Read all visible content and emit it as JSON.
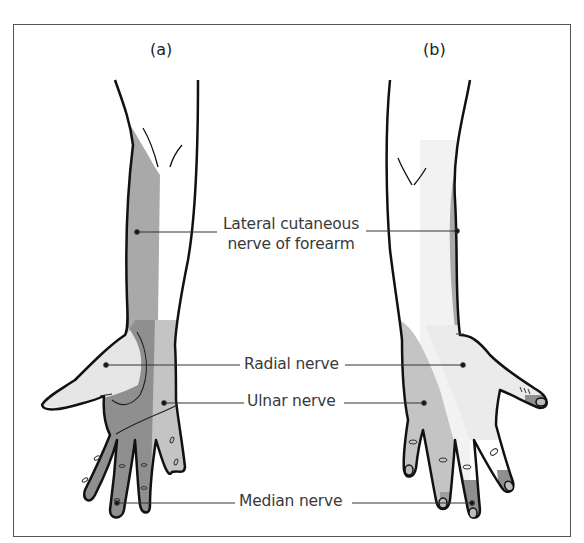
{
  "figure": {
    "panels": [
      {
        "id": "a",
        "label": "(a)",
        "view": "palmar"
      },
      {
        "id": "b",
        "label": "(b)",
        "view": "dorsal"
      }
    ],
    "labels": {
      "lateral_cutaneous_line1": "Lateral cutaneous",
      "lateral_cutaneous_line2": "nerve of forearm",
      "radial": "Radial nerve",
      "ulnar": "Ulnar nerve",
      "median": "Median nerve"
    },
    "colors": {
      "outline": "#111111",
      "lateral_cutaneous_shade": "#a9a9a9",
      "median_shade": "#8f8f8f",
      "ulnar_shade": "#c4c4c4",
      "radial_shade": "#e6e6e6",
      "leader_line": "#333333",
      "frame": "#555555"
    }
  }
}
